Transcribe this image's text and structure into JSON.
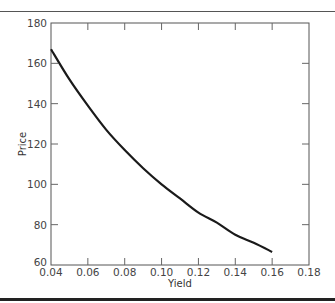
{
  "chart_data": {
    "type": "line",
    "title": "",
    "xlabel": "Yield",
    "ylabel": "Price",
    "xlim": [
      0.04,
      0.18
    ],
    "ylim": [
      60,
      180
    ],
    "xticks": [
      "0.04",
      "0.06",
      "0.08",
      "0.10",
      "0.12",
      "0.14",
      "0.16",
      "0.18"
    ],
    "yticks": [
      "60",
      "80",
      "100",
      "120",
      "140",
      "160",
      "180"
    ],
    "grid": false,
    "legend": null,
    "series": [
      {
        "name": "Price",
        "x": [
          0.04,
          0.05,
          0.06,
          0.07,
          0.08,
          0.09,
          0.1,
          0.11,
          0.12,
          0.13,
          0.14,
          0.15,
          0.16
        ],
        "values": [
          167,
          152,
          139,
          127,
          117,
          108,
          100,
          93,
          86,
          81,
          75,
          71,
          66.5
        ]
      }
    ],
    "line_color": "#1a1a1a"
  }
}
